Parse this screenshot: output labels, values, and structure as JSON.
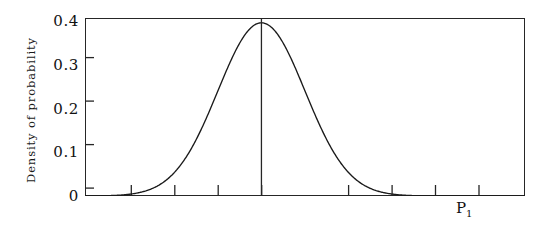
{
  "figure": {
    "background_color": "#ffffff",
    "axis_color": "#262626",
    "curve_color": "#1a1a1a",
    "shade_color": "#4a4a4a"
  },
  "axes": {
    "ylabel": "Density of probability",
    "ytick_labels": [
      "0.4",
      "0.3",
      "0.2",
      "0.1",
      "0"
    ],
    "ytick_values": [
      0.4,
      0.3,
      0.2,
      0.1,
      0
    ],
    "yminor_values": [
      0.35,
      0.25,
      0.15,
      0.05
    ],
    "ylim": [
      0,
      0.41
    ],
    "xlim": [
      -4.05,
      6.05
    ],
    "xtick_labels": [],
    "xtick_values": [
      -3,
      -2,
      -1,
      0,
      1,
      2,
      3,
      4,
      5
    ],
    "grid": "off"
  },
  "annotations": {
    "p1_label": "P",
    "p1_subscript": "1",
    "p1_x_value": 4.65,
    "center_line_x_value": 0
  },
  "chart_data": {
    "type": "line",
    "title": "",
    "xlabel": "",
    "ylabel": "Density of probability",
    "ylim": [
      0,
      0.41
    ],
    "xlim": [
      -4.05,
      6.05
    ],
    "grid": "off",
    "legend_position": "none",
    "series": [
      {
        "name": "normal-density",
        "distribution": "normal",
        "mean": 0,
        "sd": 1,
        "peak_value": 0.3989,
        "x": [
          -4.0,
          -3.75,
          -3.5,
          -3.25,
          -3.0,
          -2.75,
          -2.5,
          -2.25,
          -2.0,
          -1.75,
          -1.5,
          -1.25,
          -1.0,
          -0.75,
          -0.5,
          -0.25,
          0.0,
          0.25,
          0.5,
          0.75,
          1.0,
          1.25,
          1.5,
          1.75,
          2.0,
          2.25,
          2.5,
          2.75,
          3.0,
          3.25,
          3.5,
          3.75,
          4.0,
          4.25,
          4.5,
          4.75,
          5.0,
          5.25,
          5.5,
          5.75,
          6.0
        ],
        "y": [
          0.0001,
          0.0003,
          0.0009,
          0.002,
          0.0044,
          0.0091,
          0.0175,
          0.0317,
          0.054,
          0.0863,
          0.1295,
          0.1826,
          0.242,
          0.3011,
          0.3521,
          0.3867,
          0.3989,
          0.3867,
          0.3521,
          0.3011,
          0.242,
          0.1826,
          0.1295,
          0.0863,
          0.054,
          0.0317,
          0.0175,
          0.0091,
          0.0044,
          0.002,
          0.0009,
          0.0003,
          0.0001,
          0.0001,
          0.0,
          0.0,
          0.0,
          0.0,
          0.0,
          0.0,
          0.0
        ]
      }
    ],
    "shaded_region": {
      "name": "rejection-tail",
      "x_start": 4.15,
      "x_end": 4.45,
      "fill": "#4a4a4a",
      "label": "P1"
    },
    "vertical_line": {
      "name": "mean-line",
      "x": 0,
      "y_from": 0,
      "y_to": 0.41
    }
  }
}
